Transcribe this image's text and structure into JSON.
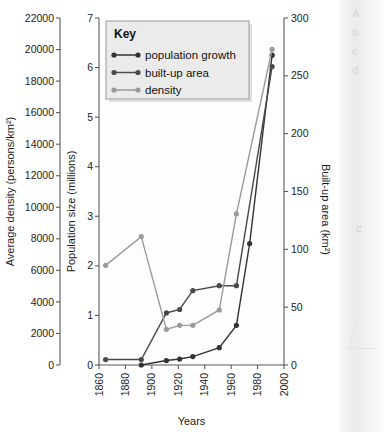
{
  "figure": {
    "name": "urban-growth-triple-axis-chart"
  },
  "chart_data": {
    "type": "line",
    "title": "",
    "xlabel": "Years",
    "grid": false,
    "legend_position": "top-left-inside",
    "legend_title": "Key",
    "x": [
      1865,
      1892,
      1911,
      1921,
      1931,
      1951,
      1964,
      1974,
      1991
    ],
    "xlim": [
      1860,
      2000
    ],
    "xticks": [
      1860,
      1880,
      1900,
      1920,
      1940,
      1960,
      1980,
      2000
    ],
    "xticklabels": [
      "1860",
      "1880",
      "1900",
      "1920",
      "1940",
      "1960",
      "1980",
      "2000"
    ],
    "axes": [
      {
        "id": "density-axis",
        "position": "left-outer",
        "label": "Average density (persons/km²)",
        "unit": "persons/km²",
        "lim": [
          0,
          22000
        ],
        "ticks": [
          0,
          2000,
          4000,
          6000,
          8000,
          10000,
          12000,
          14000,
          16000,
          18000,
          20000,
          22000
        ],
        "ticklabels": [
          "0",
          "2000",
          "4000",
          "6000",
          "8000",
          "10000",
          "12000",
          "14000",
          "16000",
          "18000",
          "20000",
          "22000"
        ]
      },
      {
        "id": "population-axis",
        "position": "left-inner",
        "label": "Population size (millions)",
        "unit": "millions",
        "lim": [
          0,
          7
        ],
        "ticks": [
          0,
          1,
          2,
          3,
          4,
          5,
          6,
          7
        ],
        "ticklabels": [
          "0",
          "1",
          "2",
          "3",
          "4",
          "5",
          "6",
          "7"
        ]
      },
      {
        "id": "builtup-axis",
        "position": "right",
        "label": "Built-up area (km²)",
        "unit": "km²",
        "lim": [
          0,
          300
        ],
        "ticks": [
          0,
          50,
          100,
          150,
          200,
          250,
          300
        ],
        "ticklabels": [
          "0",
          "50",
          "100",
          "150",
          "200",
          "250",
          "300"
        ]
      }
    ],
    "series": [
      {
        "name": "population growth",
        "axis": "population-axis",
        "color": "#333333",
        "marker": "circle",
        "x": [
          1892,
          1911,
          1921,
          1931,
          1951,
          1964,
          1974,
          1991
        ],
        "values": [
          0.0,
          0.09,
          0.12,
          0.17,
          0.35,
          0.8,
          2.45,
          6.25
        ]
      },
      {
        "name": "built-up area",
        "axis": "builtup-axis",
        "color": "#4a4a4a",
        "marker": "circle",
        "x": [
          1865,
          1892,
          1911,
          1921,
          1931,
          1951,
          1964,
          1991
        ],
        "values": [
          5,
          5,
          45,
          48,
          65,
          69,
          69,
          258
        ],
        "values_on_population_scale": [
          0.11,
          0.11,
          1.05,
          1.12,
          1.5,
          1.6,
          1.6,
          6.02
        ]
      },
      {
        "name": "density",
        "axis": "density-axis",
        "color": "#9a9a9a",
        "marker": "circle",
        "x": [
          1865,
          1892,
          1911,
          1921,
          1931,
          1951,
          1964,
          1991
        ],
        "values": [
          6300,
          8150,
          2250,
          2500,
          2500,
          3500,
          9600,
          20000
        ],
        "values_on_population_scale": [
          2.01,
          2.59,
          0.72,
          0.8,
          0.8,
          1.11,
          3.05,
          6.37
        ]
      }
    ]
  },
  "legend": {
    "title": "Key",
    "items": [
      {
        "label": "population growth",
        "color": "#333333"
      },
      {
        "label": "built-up area",
        "color": "#4a4a4a"
      },
      {
        "label": "density",
        "color": "#9a9a9a"
      }
    ]
  },
  "page_edge": {
    "lines": [
      "A",
      "b",
      "c",
      "d"
    ],
    "mid_glyph": "c"
  }
}
